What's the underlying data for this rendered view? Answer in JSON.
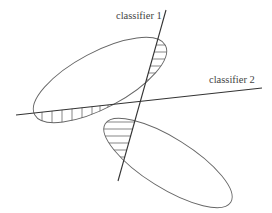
{
  "diagram": {
    "title": "",
    "labels": {
      "classifier1": "classifier 1",
      "classifier2": "classifier 2"
    },
    "elements": {
      "ellipses": [
        {
          "name": "upper-class-region",
          "cx": 100,
          "cy": 80,
          "rx": 74,
          "ry": 28,
          "rotation": -28
        },
        {
          "name": "lower-class-region",
          "cx": 168,
          "cy": 163,
          "rx": 74,
          "ry": 25,
          "rotation": 32
        }
      ],
      "lines": [
        {
          "name": "classifier-1-line",
          "x1": 166,
          "y1": 10,
          "x2": 118,
          "y2": 181
        },
        {
          "name": "classifier-2-line",
          "x1": 16,
          "y1": 115,
          "x2": 262,
          "y2": 88
        }
      ],
      "hatching": [
        {
          "region": "upper-ellipse-beyond-classifier-1",
          "style": "horizontal"
        },
        {
          "region": "upper-ellipse-below-classifier-2",
          "style": "vertical"
        },
        {
          "region": "lower-ellipse-left-of-classifier-1",
          "style": "horizontal"
        }
      ]
    },
    "colors": {
      "line": "#333333",
      "ellipse": "#666666",
      "text": "#444444",
      "background": "#ffffff"
    }
  }
}
